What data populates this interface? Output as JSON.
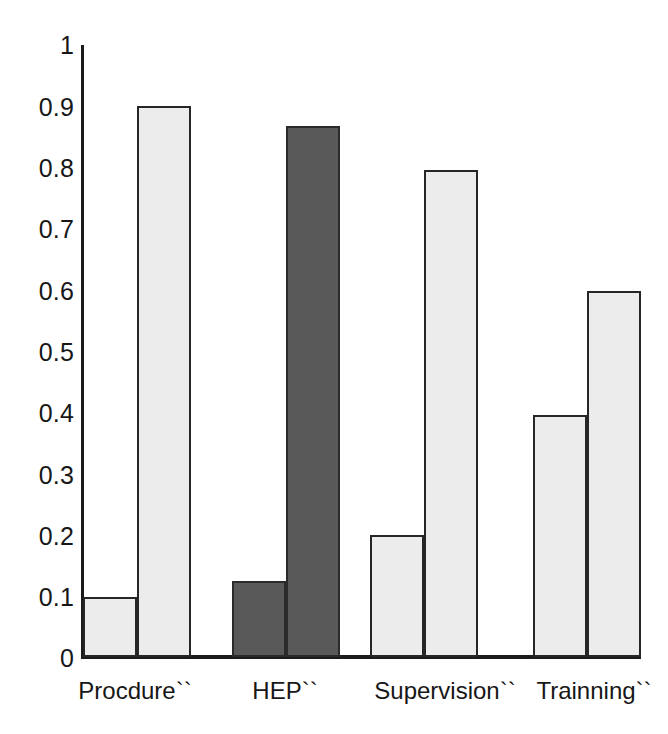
{
  "chart_data": {
    "type": "bar",
    "title": "",
    "xlabel": "",
    "ylabel": "",
    "ylim": [
      0,
      1
    ],
    "grid": false,
    "legend_position": "none",
    "categories": [
      "Procdure``",
      "HEP``",
      "Supervision``",
      "Trainning``"
    ],
    "ytick_labels": [
      "1",
      "0.9",
      "0.8",
      "0.7",
      "0.6",
      "0.5",
      "0.4",
      "0.3",
      "0.2",
      "0.1",
      "0"
    ],
    "ytick_values": [
      1,
      0.9,
      0.8,
      0.7,
      0.6,
      0.5,
      0.4,
      0.3,
      0.2,
      0.1,
      0
    ],
    "series": [
      {
        "name": "Series 1",
        "values": [
          0.098,
          0.125,
          0.2,
          0.395
        ],
        "color": "#ececec"
      },
      {
        "name": "Series 2",
        "values": [
          0.9,
          0.868,
          0.795,
          0.598
        ],
        "color": "#ececec"
      }
    ],
    "bar_fill_overrides": {
      "HEP``": "#595959"
    },
    "colors": {
      "light_bar": "#ececec",
      "dark_bar": "#595959",
      "bar_outline": "#262626",
      "axis": "#1b1b1b",
      "text": "#171717",
      "background": "#ffffff"
    }
  }
}
